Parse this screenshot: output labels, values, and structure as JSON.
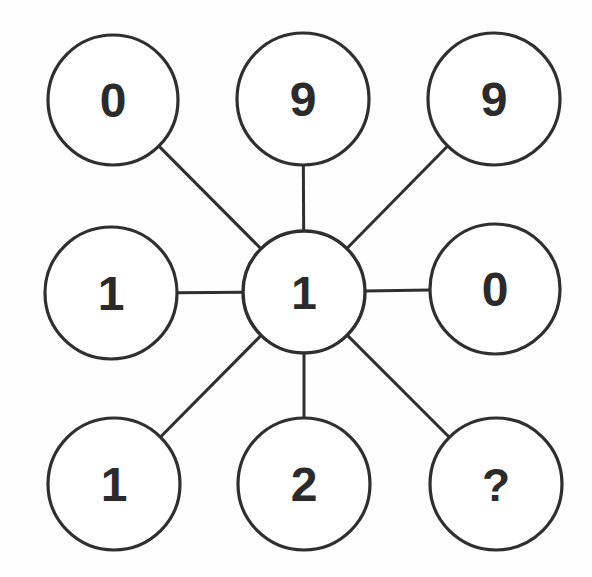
{
  "puzzle": {
    "title": "Number wheel puzzle",
    "background_color": "#fefefe",
    "stroke_color": "#2f2f2f",
    "text_color": "#2b2b2b",
    "center": {
      "id": "center",
      "label": "1",
      "cx": 304,
      "cy": 292,
      "r": 61
    },
    "outer_nodes": [
      {
        "id": "top-left",
        "label": "0",
        "cx": 113,
        "cy": 100,
        "r": 65,
        "position": "top-left"
      },
      {
        "id": "top-center",
        "label": "9",
        "cx": 303,
        "cy": 99,
        "r": 66,
        "position": "top-center"
      },
      {
        "id": "top-right",
        "label": "9",
        "cx": 494,
        "cy": 99,
        "r": 66,
        "position": "top-right"
      },
      {
        "id": "middle-left",
        "label": "1",
        "cx": 111,
        "cy": 293,
        "r": 66,
        "position": "middle-left"
      },
      {
        "id": "middle-right",
        "label": "0",
        "cx": 495,
        "cy": 289,
        "r": 65,
        "position": "middle-right"
      },
      {
        "id": "bottom-left",
        "label": "1",
        "cx": 114,
        "cy": 484,
        "r": 66,
        "position": "bottom-left"
      },
      {
        "id": "bottom-center",
        "label": "2",
        "cx": 304,
        "cy": 484,
        "r": 66,
        "position": "bottom-center"
      },
      {
        "id": "bottom-right",
        "label": "?",
        "cx": 496,
        "cy": 484,
        "r": 66,
        "position": "bottom-right"
      }
    ],
    "edges": [
      {
        "from": "center",
        "to": "top-left"
      },
      {
        "from": "center",
        "to": "top-center"
      },
      {
        "from": "center",
        "to": "top-right"
      },
      {
        "from": "center",
        "to": "middle-left"
      },
      {
        "from": "center",
        "to": "middle-right"
      },
      {
        "from": "center",
        "to": "bottom-left"
      },
      {
        "from": "center",
        "to": "bottom-center"
      },
      {
        "from": "center",
        "to": "bottom-right"
      }
    ]
  }
}
